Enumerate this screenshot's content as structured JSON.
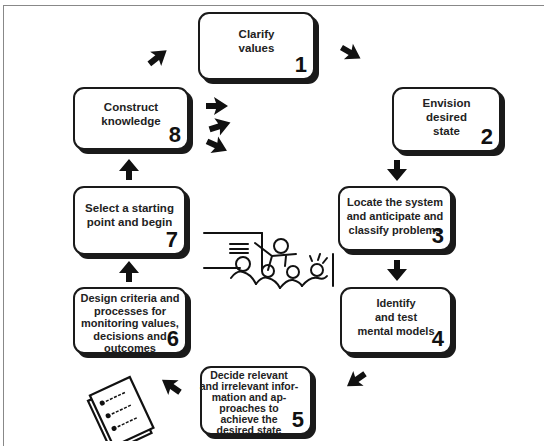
{
  "diagram": {
    "type": "cycle",
    "steps": [
      {
        "number": "1",
        "label": "Clarify values"
      },
      {
        "number": "2",
        "label": "Envision desired state"
      },
      {
        "number": "3",
        "label": "Locate the system and anticipate and classify problems"
      },
      {
        "number": "4",
        "label": "Identify and test mental models"
      },
      {
        "number": "5",
        "label": "Decide relevant and irrelevant information and approaches to achieve the desired state"
      },
      {
        "number": "6",
        "label": "Design criteria and processes for monitoring values, decisions and outcomes"
      },
      {
        "number": "7",
        "label": "Select a starting point and begin"
      },
      {
        "number": "8",
        "label": "Construct knowledge"
      }
    ],
    "lines": {
      "s1": [
        "Clarify",
        "values"
      ],
      "s2": [
        "Envision",
        "desired",
        "state"
      ],
      "s3": [
        "Locate the system",
        "and anticipate and",
        "classify problems"
      ],
      "s4": [
        "Identify",
        "and test",
        "mental models"
      ],
      "s5": [
        "Decide relevant",
        "and irrelevant infor-",
        "mation and ap-",
        "proaches to",
        "achieve the",
        "desired state"
      ],
      "s6": [
        "Design criteria and",
        "processes for",
        "monitoring values,",
        "decisions and",
        "outcomes"
      ],
      "s7": [
        "Select a starting",
        "point and begin"
      ],
      "s8": [
        "Construct",
        "knowledge"
      ]
    },
    "icons": [
      "arrow-icon",
      "classroom-teacher-illustration",
      "checklist-document-illustration"
    ],
    "colors": {
      "ink": "#1a1a1a",
      "background": "#ffffff",
      "frame": "#888888"
    }
  }
}
